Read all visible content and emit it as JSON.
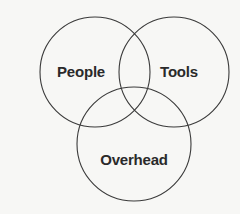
{
  "diagram": {
    "type": "venn",
    "stroke_color": "#3a3a3a",
    "background_color": "#f7f7f5",
    "sets": [
      {
        "id": "people",
        "label": "People",
        "cx": 95,
        "cy": 72,
        "r": 55,
        "label_x": 81,
        "label_y": 71
      },
      {
        "id": "tools",
        "label": "Tools",
        "cx": 174,
        "cy": 72,
        "r": 55,
        "label_x": 179,
        "label_y": 71
      },
      {
        "id": "overhead",
        "label": "Overhead",
        "cx": 134,
        "cy": 144,
        "r": 57,
        "label_x": 134,
        "label_y": 159
      }
    ]
  }
}
